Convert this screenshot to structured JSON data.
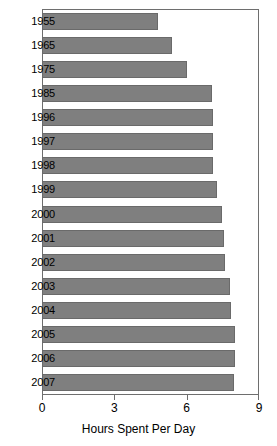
{
  "chart_data": {
    "type": "bar",
    "orientation": "horizontal",
    "title": "",
    "xlabel": "Hours Spent Per Day",
    "ylabel": "",
    "xlim": [
      0,
      9
    ],
    "xticks": [
      0,
      3,
      6,
      9
    ],
    "xtick_labels": [
      "0",
      "3",
      "6",
      "9"
    ],
    "grid": false,
    "legend": false,
    "bar_color": "#7f7f7f",
    "bar_edge_color": "#6a6a6a",
    "frame_color": "#6e6e6e",
    "categories": [
      "1955",
      "1965",
      "1975",
      "1985",
      "1996",
      "1997",
      "1998",
      "1999",
      "2000",
      "2001",
      "2002",
      "2003",
      "2004",
      "2005",
      "2006",
      "2007"
    ],
    "values": [
      4.8,
      5.4,
      6.0,
      7.05,
      7.1,
      7.1,
      7.1,
      7.25,
      7.45,
      7.55,
      7.6,
      7.8,
      7.85,
      8.0,
      8.0,
      7.95
    ]
  }
}
